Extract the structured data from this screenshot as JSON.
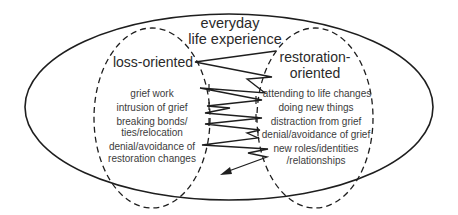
{
  "diagram": {
    "title_line1": "everyday",
    "title_line2": "life experience",
    "loss": {
      "heading": "loss-oriented",
      "items": [
        "grief work",
        "intrusion of grief",
        "breaking bonds/",
        "ties/relocation",
        "denial/avoidance of",
        "restoration changes"
      ]
    },
    "restoration": {
      "heading_line1": "restoration-",
      "heading_line2": "oriented",
      "items": [
        "attending to life changes",
        "doing new things",
        "distraction from grief",
        "denial/avoidance of grief",
        "new roles/identities",
        "/relationships"
      ]
    },
    "colors": {
      "line": "#1e1e1e",
      "text": "#3a3a3a",
      "background": "#ffffff"
    }
  }
}
